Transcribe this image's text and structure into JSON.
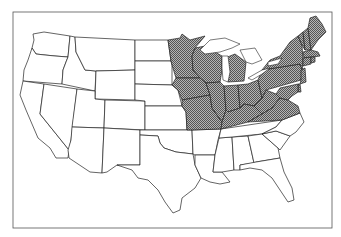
{
  "map": {
    "title": "",
    "region": "Contiguous United States",
    "colors": {
      "background": "#ffffff",
      "outline": "#222222",
      "shaded_fill": "#8a8a8a",
      "frame": "#555555"
    },
    "legend": {
      "shaded_meaning": "Highlighted states (northeast and midwest)"
    },
    "shaded_states": [
      "Minnesota",
      "Wisconsin",
      "Michigan",
      "Iowa",
      "Missouri",
      "Illinois",
      "Indiana",
      "Ohio",
      "Kentucky",
      "West Virginia",
      "Virginia",
      "Pennsylvania",
      "New York",
      "Vermont",
      "New Hampshire",
      "Maine",
      "Massachusetts",
      "Connecticut",
      "Rhode Island",
      "New Jersey",
      "Delaware",
      "Maryland"
    ],
    "unshaded_states": [
      "Washington",
      "Oregon",
      "California",
      "Nevada",
      "Idaho",
      "Montana",
      "Wyoming",
      "Utah",
      "Arizona",
      "Colorado",
      "New Mexico",
      "North Dakota",
      "South Dakota",
      "Nebraska",
      "Kansas",
      "Oklahoma",
      "Texas",
      "Arkansas",
      "Louisiana",
      "Mississippi",
      "Alabama",
      "Tennessee",
      "Georgia",
      "Florida",
      "South Carolina",
      "North Carolina"
    ]
  }
}
